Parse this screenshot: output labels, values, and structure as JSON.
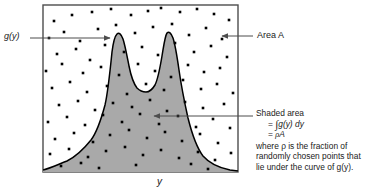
{
  "figure": {
    "title_alt": "Monte Carlo area-under-curve diagram",
    "frame": {
      "x": 43,
      "y": 5,
      "width": 195,
      "height": 167,
      "stroke": "#4d4d4d",
      "fill": "#ffffff"
    },
    "shaded_fill": "#a9a9a9",
    "curve_stroke": "#000000",
    "dot_color": "#000000",
    "dot_size": 2.6
  },
  "labels": {
    "curve_label": "g(y)",
    "area_label": "Area A",
    "axis_label": "y"
  },
  "callout": {
    "line1": "Shaded area",
    "line2_prefix": "= ",
    "line2_integral": "∫",
    "line2_body": "g(y) dy",
    "line3_prefix": "= ",
    "line3_rho": "ρ",
    "line3_body": "A",
    "line4": "where ρ is the fraction of",
    "line5": "randomly chosen points that",
    "line6": "lie under the curve of g(y)."
  },
  "arrows": {
    "curve_arrow": {
      "from_x": 30,
      "from_y": 38,
      "to_x": 113,
      "to_y": 38,
      "direction": "right"
    },
    "area_arrow": {
      "from_x": 253,
      "from_y": 36,
      "to_x": 219,
      "to_y": 36,
      "direction": "left"
    },
    "shaded_arrow": {
      "from_x": 253,
      "from_y": 116,
      "to_x": 151,
      "to_y": 116,
      "direction": "left"
    }
  },
  "chart_data": {
    "type": "area",
    "title": "",
    "xlabel": "y",
    "ylabel": "g(y)",
    "grid": false,
    "legend": "none",
    "xlim": [
      0,
      195
    ],
    "ylim": [
      0,
      167
    ],
    "curve_points": [
      [
        0,
        2
      ],
      [
        8,
        4
      ],
      [
        16,
        7
      ],
      [
        24,
        11
      ],
      [
        32,
        17
      ],
      [
        40,
        26
      ],
      [
        48,
        40
      ],
      [
        56,
        60
      ],
      [
        62,
        80
      ],
      [
        67,
        104
      ],
      [
        71,
        126
      ],
      [
        74,
        134
      ],
      [
        77,
        138
      ],
      [
        80,
        134
      ],
      [
        83,
        122
      ],
      [
        87,
        104
      ],
      [
        91,
        88
      ],
      [
        95,
        82
      ],
      [
        99,
        80
      ],
      [
        104,
        82
      ],
      [
        108,
        90
      ],
      [
        112,
        106
      ],
      [
        116,
        124
      ],
      [
        119,
        134
      ],
      [
        122,
        139
      ],
      [
        125,
        136
      ],
      [
        128,
        126
      ],
      [
        132,
        108
      ],
      [
        137,
        86
      ],
      [
        143,
        64
      ],
      [
        150,
        46
      ],
      [
        157,
        33
      ],
      [
        165,
        23
      ],
      [
        174,
        15
      ],
      [
        183,
        9
      ],
      [
        190,
        5
      ],
      [
        195,
        3
      ]
    ],
    "peaks": [
      {
        "label": "left peak",
        "x": 76,
        "y": 138
      },
      {
        "label": "right peak",
        "x": 121,
        "y": 139
      }
    ],
    "valley": {
      "x": 97,
      "y": 80
    },
    "points_inside_count": 47,
    "points_outside_count": 55,
    "points": [
      [
        11,
        151
      ],
      [
        29,
        157
      ],
      [
        49,
        160
      ],
      [
        68,
        163
      ],
      [
        88,
        157
      ],
      [
        105,
        161
      ],
      [
        118,
        164
      ],
      [
        137,
        160
      ],
      [
        154,
        163
      ],
      [
        171,
        158
      ],
      [
        186,
        152
      ],
      [
        6,
        134
      ],
      [
        21,
        140
      ],
      [
        37,
        131
      ],
      [
        55,
        143
      ],
      [
        73,
        147
      ],
      [
        92,
        139
      ],
      [
        110,
        145
      ],
      [
        129,
        148
      ],
      [
        146,
        137
      ],
      [
        163,
        144
      ],
      [
        179,
        133
      ],
      [
        14,
        118
      ],
      [
        33,
        123
      ],
      [
        47,
        112
      ],
      [
        62,
        127
      ],
      [
        81,
        120
      ],
      [
        99,
        125
      ],
      [
        115,
        117
      ],
      [
        132,
        129
      ],
      [
        151,
        120
      ],
      [
        168,
        126
      ],
      [
        184,
        115
      ],
      [
        3,
        101
      ],
      [
        19,
        108
      ],
      [
        40,
        99
      ],
      [
        58,
        105
      ],
      [
        76,
        97
      ],
      [
        95,
        108
      ],
      [
        112,
        101
      ],
      [
        128,
        95
      ],
      [
        145,
        107
      ],
      [
        161,
        100
      ],
      [
        177,
        104
      ],
      [
        9,
        84
      ],
      [
        27,
        90
      ],
      [
        44,
        80
      ],
      [
        64,
        86
      ],
      [
        84,
        78
      ],
      [
        103,
        88
      ],
      [
        121,
        82
      ],
      [
        140,
        92
      ],
      [
        158,
        83
      ],
      [
        174,
        88
      ],
      [
        190,
        79
      ],
      [
        16,
        67
      ],
      [
        35,
        71
      ],
      [
        52,
        62
      ],
      [
        70,
        69
      ],
      [
        89,
        65
      ],
      [
        107,
        72
      ],
      [
        124,
        61
      ],
      [
        142,
        70
      ],
      [
        160,
        64
      ],
      [
        181,
        68
      ],
      [
        5,
        50
      ],
      [
        24,
        55
      ],
      [
        42,
        47
      ],
      [
        60,
        57
      ],
      [
        79,
        50
      ],
      [
        97,
        58
      ],
      [
        116,
        48
      ],
      [
        135,
        56
      ],
      [
        153,
        45
      ],
      [
        170,
        53
      ],
      [
        187,
        44
      ],
      [
        12,
        33
      ],
      [
        31,
        39
      ],
      [
        50,
        30
      ],
      [
        67,
        37
      ],
      [
        86,
        42
      ],
      [
        104,
        34
      ],
      [
        122,
        40
      ],
      [
        139,
        31
      ],
      [
        157,
        38
      ],
      [
        175,
        29
      ],
      [
        7,
        18
      ],
      [
        26,
        23
      ],
      [
        45,
        15
      ],
      [
        63,
        21
      ],
      [
        82,
        25
      ],
      [
        100,
        17
      ],
      [
        118,
        22
      ],
      [
        136,
        14
      ],
      [
        155,
        20
      ],
      [
        172,
        12
      ],
      [
        188,
        19
      ],
      [
        18,
        6
      ],
      [
        38,
        9
      ],
      [
        56,
        4
      ],
      [
        93,
        7
      ],
      [
        148,
        8
      ],
      [
        165,
        3
      ]
    ]
  }
}
